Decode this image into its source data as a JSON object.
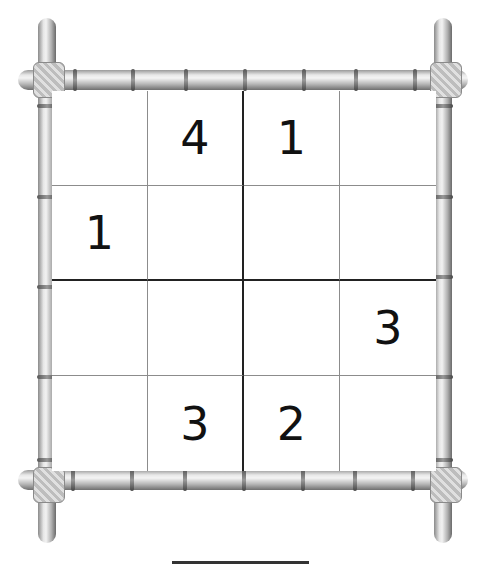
{
  "puzzle": {
    "type": "sudoku-4x4",
    "size": 4,
    "box_rows": 2,
    "box_cols": 2,
    "grid": [
      [
        "",
        "4",
        "1",
        ""
      ],
      [
        "1",
        "",
        "",
        ""
      ],
      [
        "",
        "",
        "",
        "3"
      ],
      [
        "",
        "3",
        "2",
        ""
      ]
    ]
  },
  "frame": {
    "style": "bamboo",
    "corner_decoration": "rope-knot"
  },
  "colors": {
    "digit": "#111111",
    "thin_line": "#8c8c8c",
    "thick_line": "#222222",
    "background": "#ffffff"
  }
}
